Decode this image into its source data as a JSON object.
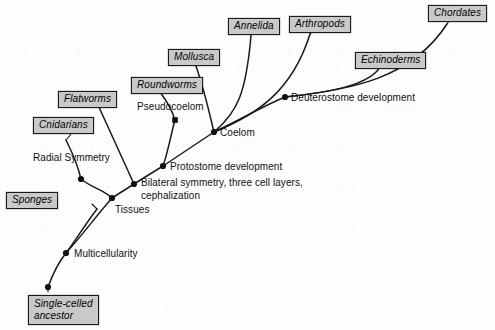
{
  "diagram": {
    "type": "phylogenetic-tree",
    "background_color": "#fdfdfd",
    "box_fill_color": "#c9c9c9",
    "line_color": "#1a1a1a"
  },
  "taxa": [
    {
      "id": "single-celled-ancestor",
      "label": "Single-celled\nancestor",
      "line1": "Single-celled",
      "line2": "ancestor",
      "x": 28,
      "y": 295
    },
    {
      "id": "sponges",
      "label": "Sponges",
      "x": 6,
      "y": 192
    },
    {
      "id": "cnidarians",
      "label": "Cnidarians",
      "x": 33,
      "y": 117
    },
    {
      "id": "flatworms",
      "label": "Flatworms",
      "x": 58,
      "y": 91
    },
    {
      "id": "roundworms",
      "label": "Roundworms",
      "x": 131,
      "y": 77
    },
    {
      "id": "mollusca",
      "label": "Mollusca",
      "x": 168,
      "y": 49
    },
    {
      "id": "annelida",
      "label": "Annelida",
      "x": 228,
      "y": 18
    },
    {
      "id": "arthropods",
      "label": "Arthropods",
      "x": 289,
      "y": 16
    },
    {
      "id": "echinoderms",
      "label": "Echinoderms",
      "x": 355,
      "y": 52
    },
    {
      "id": "chordates",
      "label": "Chordates",
      "x": 428,
      "y": 5
    }
  ],
  "traits": [
    {
      "id": "multicellularity",
      "label": "Multicellularity",
      "x": 74,
      "y": 248,
      "node_x": 66,
      "node_y": 253
    },
    {
      "id": "tissues",
      "label": "Tissues",
      "x": 115,
      "y": 204,
      "node_x": 112,
      "node_y": 198
    },
    {
      "id": "radial-symmetry",
      "label": "Radial Symmetry",
      "x": 33,
      "y": 152,
      "node_x": 81,
      "node_y": 179
    },
    {
      "id": "bilateral-symmetry",
      "label": "Bilateral symmetry, three cell layers, cephalization",
      "x": 141,
      "y": 177,
      "node_x": 134,
      "node_y": 184
    },
    {
      "id": "protostome-development",
      "label": "Protostome development",
      "x": 170,
      "y": 161,
      "node_x": 163,
      "node_y": 166
    },
    {
      "id": "pseudocoelom",
      "label": "Pseudocoelom",
      "x": 137,
      "y": 101,
      "node_x": 175,
      "node_y": 120
    },
    {
      "id": "coelom",
      "label": "Coelom",
      "x": 220,
      "y": 127,
      "node_x": 214,
      "node_y": 132
    },
    {
      "id": "deuterostome-development",
      "label": "Deuterostome development",
      "x": 291,
      "y": 92,
      "node_x": 285,
      "node_y": 97
    }
  ],
  "branches": {
    "trunk_root_to_multicellularity": "M48,287 C52,276 58,263 66,253",
    "multicellularity_to_tissues": "M66,253 C80,238 97,215 112,198",
    "tissues_to_bilateral": "M112,198 L134,184",
    "bilateral_to_protostome": "M134,184 L163,166",
    "protostome_to_coelom": "M163,166 L214,132",
    "coelom_to_deuterostome": "M214,132 C240,120 263,106 285,97",
    "sponges_branch": "M66,253 C76,240 84,226 97,209",
    "cnidarians_branch": "M112,198 C104,190 92,188 81,179",
    "radial_to_cnidarian_tip": "M81,179 C78,166 72,152 66,140",
    "flatworms_branch": "M134,184 L98,105",
    "protostome_to_pseudocoelom": "M163,166 C168,152 171,134 175,120",
    "roundworms_branch": "M175,120 C172,110 166,100 160,92",
    "mollusca_branch": "M214,132 C210,116 205,92 196,66",
    "annelida_branch": "M214,132 C238,112 246,92 251,36",
    "arthropods_branch": "M214,132 C256,115 292,92 310,34",
    "echinoderms_branch": "M285,97 C330,92 364,86 378,70",
    "chordates_branch": "M285,97 C352,90 412,78 447,24"
  },
  "leaders": {
    "cnidarians_leader": "M66,140 L72,133",
    "roundworms_leader": "M160,92 L166,89",
    "mollusca_leader": "M196,66 L196,63",
    "annelida_leader": "M251,36 L251,33",
    "arthropods_leader": "M310,34 L313,31",
    "echinoderms_leader": "M378,70 L379,68",
    "chordates_leader": "M447,24 L449,21",
    "sponges_leader": "M97,209 L92,204",
    "flatworms_leader": "M98,105 L97,103",
    "root_leader": "M48,287 L48,292"
  },
  "nodes": [
    {
      "id": "node-root",
      "x": 48,
      "y": 287,
      "shape": "circle"
    },
    {
      "id": "node-multicellularity",
      "x": 66,
      "y": 253,
      "shape": "circle"
    },
    {
      "id": "node-tissues",
      "x": 112,
      "y": 198,
      "shape": "circle"
    },
    {
      "id": "node-radial-symmetry",
      "x": 81,
      "y": 179,
      "shape": "circle"
    },
    {
      "id": "node-bilateral-symmetry",
      "x": 134,
      "y": 184,
      "shape": "circle"
    },
    {
      "id": "node-protostome",
      "x": 163,
      "y": 166,
      "shape": "circle"
    },
    {
      "id": "node-pseudocoelom",
      "x": 175,
      "y": 120,
      "shape": "square"
    },
    {
      "id": "node-coelom",
      "x": 214,
      "y": 132,
      "shape": "circle"
    },
    {
      "id": "node-deuterostome",
      "x": 285,
      "y": 97,
      "shape": "circle"
    }
  ]
}
